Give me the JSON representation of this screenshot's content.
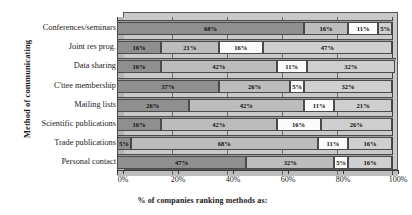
{
  "chart_data": {
    "type": "bar",
    "orientation": "horizontal",
    "stacked": true,
    "normalized": "100%",
    "title": "",
    "xlabel": "% of companies ranking methods as:",
    "ylabel": "Method of communicating",
    "xlim": [
      0,
      100
    ],
    "xticks": [
      0,
      20,
      40,
      60,
      80,
      100
    ],
    "xtick_labels": [
      "0%",
      "20%",
      "40%",
      "60%",
      "80%",
      "100%"
    ],
    "grid": true,
    "legend": "none",
    "categories": [
      "Conferences/seminars",
      "Joint res prog.",
      "Data sharing",
      "C'ttee membership",
      "Mailing lists",
      "Scientific publications",
      "Trade publications",
      "Personal contact"
    ],
    "series": [
      {
        "name": "rank 1",
        "color": "#8f8f8f",
        "values": [
          68,
          16,
          16,
          37,
          26,
          16,
          5,
          47
        ]
      },
      {
        "name": "rank 2",
        "color": "#bcbcbc",
        "values": [
          16,
          21,
          42,
          26,
          42,
          42,
          68,
          32
        ]
      },
      {
        "name": "rank 3",
        "color": "#fbfbfb",
        "values": [
          11,
          16,
          11,
          5,
          11,
          16,
          11,
          5
        ]
      },
      {
        "name": "rank 4",
        "color": "#cfcfcf",
        "values": [
          5,
          47,
          32,
          32,
          21,
          26,
          16,
          16
        ]
      }
    ],
    "data_labels": [
      [
        "68%",
        "16%",
        "11%",
        "5%"
      ],
      [
        "16%",
        "21%",
        "16%",
        "47%"
      ],
      [
        "16%",
        "42%",
        "11%",
        "32%"
      ],
      [
        "37%",
        "26%",
        "5%",
        "32%"
      ],
      [
        "26%",
        "42%",
        "11%",
        "21%"
      ],
      [
        "16%",
        "42%",
        "16%",
        "26%"
      ],
      [
        "5%",
        "68%",
        "11%",
        "16%"
      ],
      [
        "47%",
        "32%",
        "5%",
        "16%"
      ]
    ]
  }
}
